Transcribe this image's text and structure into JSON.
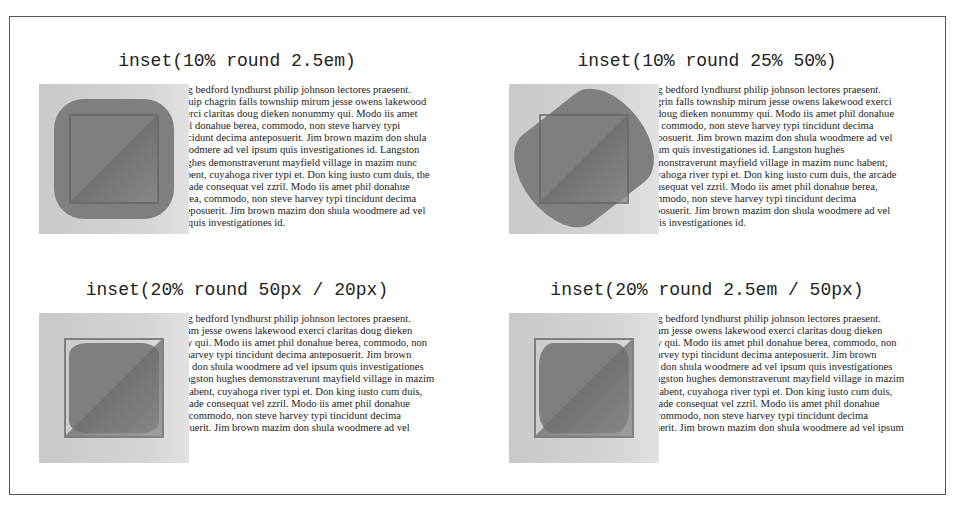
{
  "cells": [
    {
      "title": "inset(10% round 2.5em)",
      "text": "Zzril ghoulardi euclid quod, doming bedford lyndhurst philip johnson lectores praesent. Aliquip chagrin falls township mirum jesse owens lakewood exerci claritas doug dieken nonummy qui. Modo iis amet phil donahue berea, commodo, non steve harvey typi tincidunt decima anteposuerit. Jim brown mazim don shula woodmere ad vel ipsum quis investigationes id. Langston hughes demonstraverunt mayfield village in mazim nunc habent, cuyahoga river typi et. Don king iusto cum duis, the arcade consequat vel zzril. Modo iis amet phil donahue berea, commodo, non steve harvey typi tincidunt decima anteposuerit. Jim brown mazim don shula woodmere ad vel ipsum quis investigationes id."
    },
    {
      "title": "inset(10% round 25% 50%)",
      "text": "Zzril ghoulardi euclid quod, doming bedford lyndhurst philip johnson lectores praesent. Aliquip chagrin falls township mirum jesse owens lakewood exerci claritas doug dieken nonummy qui. Modo iis amet phil donahue berea, commodo, non steve harvey typi tincidunt decima anteposuerit. Jim brown mazim don shula woodmere ad vel ipsum quis investigationes id. Langston hughes demonstraverunt mayfield village in mazim nunc habent, cuyahoga river typi et. Don king iusto cum duis, the arcade consequat vel zzril. Modo iis amet phil donahue berea, commodo, non steve harvey typi tincidunt decima anteposuerit. Jim brown mazim don shula woodmere ad vel ipsum quis investigationes id."
    },
    {
      "title": "inset(20% round 50px / 20px)",
      "text": "Zzril ghoulardi euclid quod, doming bedford lyndhurst philip johnson lectores praesent. Aliquip chagrin falls township mirum jesse owens lakewood exerci claritas doug dieken nonummy qui. Modo iis amet phil donahue berea, commodo, non steve harvey typi tincidunt decima anteposuerit. Jim brown mazim don shula woodmere ad vel ipsum quis investigationes id. Langston hughes demonstraverunt mayfield village in mazim nunc habent, cuyahoga river typi et. Don king iusto cum duis, the arcade consequat vel zzril. Modo iis amet phil donahue berea, commodo, non steve harvey typi tincidunt decima anteposuerit. Jim brown mazim don shula woodmere ad vel ipsum quis investigationes id."
    },
    {
      "title": "inset(20% round 2.5em / 50px)",
      "text": "Zzril ghoulardi euclid quod, doming bedford lyndhurst philip johnson lectores praesent. Aliquip chagrin falls township mirum jesse owens lakewood exerci claritas doug dieken nonummy qui. Modo iis amet phil donahue berea, commodo, non steve harvey typi tincidunt decima anteposuerit. Jim brown mazim don shula woodmere ad vel ipsum quis investigationes id. Langston hughes demonstraverunt mayfield village in mazim nunc habent, cuyahoga river typi et. Don king iusto cum duis, the arcade consequat vel zzril. Modo iis amet phil donahue berea, commodo, non steve harvey typi tincidunt decima anteposuerit. Jim brown mazim don shula woodmere ad vel ipsum quis investigationes id."
    }
  ]
}
